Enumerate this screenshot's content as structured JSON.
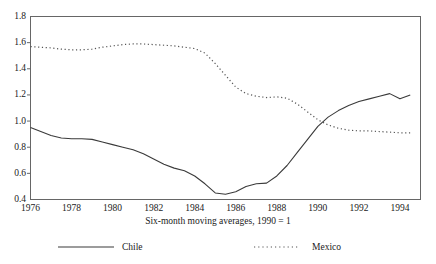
{
  "chart_data": {
    "type": "line",
    "title": "",
    "subtitle": "Six-month moving averages, 1990 = 1",
    "xlabel": "",
    "ylabel": "",
    "xlim": [
      1976,
      1995
    ],
    "ylim": [
      0.4,
      1.8
    ],
    "grid": false,
    "legend_position": "bottom",
    "xticks": [
      1976,
      1978,
      1980,
      1982,
      1984,
      1986,
      1988,
      1990,
      1992,
      1994
    ],
    "xtick_labels": [
      "1976",
      "1978",
      "1980",
      "1982",
      "1984",
      "1986",
      "1988",
      "1990",
      "1992",
      "1994"
    ],
    "yticks": [
      0.4,
      0.6,
      0.8,
      1.0,
      1.2,
      1.4,
      1.6,
      1.8
    ],
    "ytick_labels": [
      "0.4",
      "0.6",
      "0.8",
      "1.0",
      "1.2",
      "1.4",
      "1.6",
      "1.8"
    ],
    "series": [
      {
        "name": "Chile",
        "style": "solid",
        "color": "#3a3a3a",
        "x": [
          1976.0,
          1976.5,
          1977.0,
          1977.5,
          1978.0,
          1978.5,
          1979.0,
          1979.5,
          1980.0,
          1980.5,
          1981.0,
          1981.5,
          1982.0,
          1982.5,
          1983.0,
          1983.5,
          1984.0,
          1984.5,
          1985.0,
          1985.5,
          1986.0,
          1986.5,
          1987.0,
          1987.5,
          1988.0,
          1988.5,
          1989.0,
          1989.5,
          1990.0,
          1990.5,
          1991.0,
          1991.5,
          1992.0,
          1992.5,
          1993.0,
          1993.5,
          1994.0,
          1994.5
        ],
        "y": [
          0.95,
          0.92,
          0.89,
          0.87,
          0.865,
          0.865,
          0.86,
          0.84,
          0.82,
          0.8,
          0.78,
          0.75,
          0.71,
          0.67,
          0.64,
          0.62,
          0.58,
          0.52,
          0.45,
          0.44,
          0.46,
          0.5,
          0.52,
          0.525,
          0.58,
          0.66,
          0.76,
          0.86,
          0.96,
          1.03,
          1.08,
          1.12,
          1.15,
          1.17,
          1.19,
          1.21,
          1.17,
          1.2
        ]
      },
      {
        "name": "Mexico",
        "style": "dotted",
        "color": "#555555",
        "x": [
          1976.0,
          1976.5,
          1977.0,
          1977.5,
          1978.0,
          1978.5,
          1979.0,
          1979.5,
          1980.0,
          1980.5,
          1981.0,
          1981.5,
          1982.0,
          1982.5,
          1983.0,
          1983.5,
          1984.0,
          1984.5,
          1985.0,
          1985.5,
          1986.0,
          1986.5,
          1987.0,
          1987.5,
          1988.0,
          1988.5,
          1989.0,
          1989.5,
          1990.0,
          1990.5,
          1991.0,
          1991.5,
          1992.0,
          1992.5,
          1993.0,
          1993.5,
          1994.0,
          1994.5
        ],
        "y": [
          1.57,
          1.565,
          1.56,
          1.55,
          1.545,
          1.545,
          1.55,
          1.565,
          1.575,
          1.585,
          1.59,
          1.59,
          1.585,
          1.58,
          1.575,
          1.565,
          1.555,
          1.52,
          1.44,
          1.35,
          1.26,
          1.21,
          1.19,
          1.18,
          1.185,
          1.175,
          1.13,
          1.07,
          1.01,
          0.97,
          0.945,
          0.93,
          0.925,
          0.925,
          0.92,
          0.915,
          0.91,
          0.91
        ]
      }
    ]
  },
  "legend": {
    "entries": [
      {
        "label": "Chile",
        "style": "solid"
      },
      {
        "label": "Mexico",
        "style": "dotted"
      }
    ]
  },
  "caption": "Six-month moving averages, 1990 = 1",
  "colors": {
    "axis": "#666666",
    "chile": "#3a3a3a",
    "mexico": "#555555",
    "background": "#ffffff"
  }
}
